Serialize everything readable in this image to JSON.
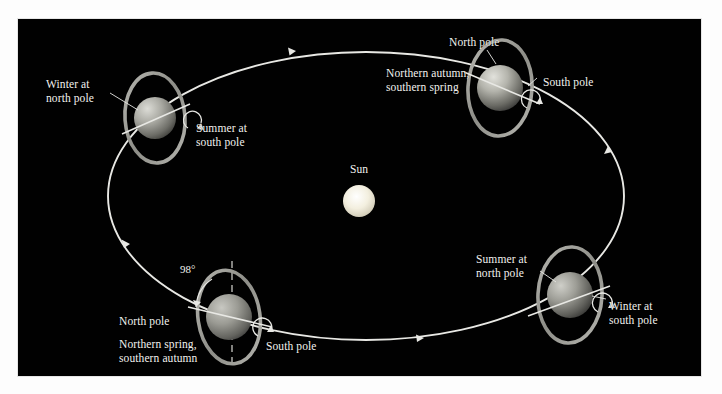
{
  "figure": {
    "background_color": "#010101",
    "page_color": "#ffffff",
    "label_color": "#f2f2ee",
    "orbit_color": "#e8e8e4",
    "ring_color": "#9a9a96",
    "frame": {
      "x": 18,
      "y": 19,
      "width": 683,
      "height": 357
    }
  },
  "sun": {
    "label": "Sun",
    "cx": 359,
    "cy": 201,
    "r": 16,
    "color": "#fbf7e6",
    "label_x": 359,
    "label_y": 167
  },
  "orbit": {
    "cx": 366,
    "cy": 196,
    "rx": 258,
    "ry": 144,
    "direction": "counterclockwise",
    "arrow_positions": [
      "top",
      "left",
      "bottom",
      "right"
    ]
  },
  "axis_annotation": {
    "value": "98°",
    "x": 180,
    "y": 263,
    "description": "axial tilt of Uranus relative to orbital plane normal"
  },
  "planets": [
    {
      "id": "winter-north",
      "cx": 155,
      "cy": 118,
      "r": 21,
      "ring_rx": 30,
      "ring_ry": 45,
      "ring_rotate": -4,
      "labels": [
        {
          "name": "season-label",
          "text": "Winter at\nnorth pole",
          "x": 46,
          "y": 78,
          "align": "left"
        },
        {
          "name": "season-label",
          "text": "Summer at\nsouth pole",
          "x": 196,
          "y": 122,
          "align": "left"
        }
      ]
    },
    {
      "id": "northern-autumn",
      "cx": 500,
      "cy": 88,
      "r": 23,
      "ring_rx": 32,
      "ring_ry": 48,
      "ring_rotate": 3,
      "labels": [
        {
          "name": "pole-label",
          "text": "North pole",
          "x": 449,
          "y": 36,
          "align": "left"
        },
        {
          "name": "season-label",
          "text": "Northern autumn,\nsouthern spring",
          "x": 386,
          "y": 67,
          "align": "left"
        },
        {
          "name": "pole-label",
          "text": "South pole",
          "x": 543,
          "y": 76,
          "align": "left"
        }
      ]
    },
    {
      "id": "summer-north",
      "cx": 570,
      "cy": 295,
      "r": 23,
      "ring_rx": 32,
      "ring_ry": 48,
      "ring_rotate": 3,
      "labels": [
        {
          "name": "season-label",
          "text": "Summer at\nnorth pole",
          "x": 476,
          "y": 253,
          "align": "left"
        },
        {
          "name": "season-label",
          "text": "Winter at\nsouth pole",
          "x": 609,
          "y": 300,
          "align": "left"
        }
      ]
    },
    {
      "id": "northern-spring",
      "cx": 229,
      "cy": 317,
      "r": 23,
      "ring_rx": 31,
      "ring_ry": 47,
      "ring_rotate": -3,
      "labels": [
        {
          "name": "pole-label",
          "text": "North pole",
          "x": 119,
          "y": 315,
          "align": "left"
        },
        {
          "name": "season-label",
          "text": "Northern spring,\nsouthern autumn",
          "x": 119,
          "y": 338,
          "align": "left"
        },
        {
          "name": "pole-label",
          "text": "South pole",
          "x": 266,
          "y": 340,
          "align": "left"
        }
      ]
    }
  ]
}
